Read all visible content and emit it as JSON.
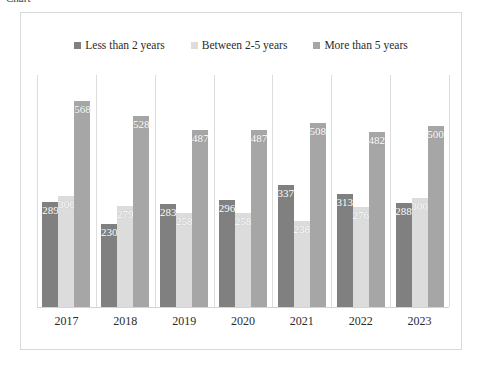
{
  "top_sliver_text": "Chart",
  "colors": {
    "series1": "#808080",
    "series2": "#dcdcdc",
    "series3": "#a6a6a6",
    "frame_border": "#d9d9d9",
    "separator": "#dddddd",
    "axis_line": "#d4d4d4",
    "label_text": "#ffffff",
    "tick_text": "#2b2b2b"
  },
  "legend": {
    "position": "top-center",
    "items": [
      {
        "label": "Less than 2 years",
        "color": "#808080"
      },
      {
        "label": "Between 2-5 years",
        "color": "#dcdcdc"
      },
      {
        "label": "More than 5 years",
        "color": "#a6a6a6"
      }
    ]
  },
  "chart_data": {
    "type": "bar",
    "title": "",
    "subtitle": "",
    "xlabel": "",
    "ylabel": "",
    "grid": false,
    "legend_position": "top-center",
    "axis_visible": {
      "x": true,
      "y": false
    },
    "ylim": [
      0,
      640
    ],
    "categories": [
      "2017",
      "2018",
      "2019",
      "2020",
      "2021",
      "2022",
      "2023"
    ],
    "series": [
      {
        "name": "Less than 2 years",
        "color": "#808080",
        "values": [
          289,
          230,
          283,
          296,
          337,
          313,
          288
        ]
      },
      {
        "name": "Between 2-5 years",
        "color": "#dcdcdc",
        "values": [
          306,
          279,
          258,
          258,
          238,
          276,
          300
        ]
      },
      {
        "name": "More than 5 years",
        "color": "#a6a6a6",
        "values": [
          568,
          528,
          487,
          487,
          508,
          482,
          500
        ]
      }
    ],
    "data_labels": {
      "visible": true,
      "position": "inside-top",
      "color": "#ffffff"
    }
  }
}
